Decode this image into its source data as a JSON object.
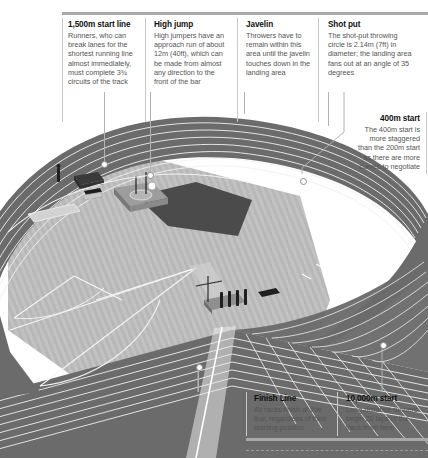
{
  "figure": {
    "rules": {
      "accent": "#a9a9a9",
      "divider": "#c9c9c9",
      "leader": "#b2b2b2"
    }
  },
  "callouts": {
    "top": [
      {
        "id": "start-1500m",
        "title": "1,500m start line",
        "body": "Runners, who can break lanes for the shortest running line almost immediately, must complete 3¾ circuits of the track"
      },
      {
        "id": "high-jump",
        "title": "High jump",
        "body": "High jumpers have an approach run of about 12m (40ft), which can be made from almost any direction to the front of the bar"
      },
      {
        "id": "javelin",
        "title": "Javelin",
        "body": "Throwers have to remain within this area until the javelin touches down in the landing area"
      },
      {
        "id": "shot-put",
        "title": "Shot put",
        "body": "The shot-put throwing circle is 2.14m (7ft) in diameter; the landing area fans out at an angle of 35 degrees"
      }
    ],
    "right": {
      "id": "start-400m",
      "title": "400m start",
      "body": "The 400m start is more staggered than the 200m start as there are more curves to negotiate"
    },
    "bottom": [
      {
        "id": "finish-line",
        "title": "Finish Line",
        "body": "All races finish at this line, regardless of their starting position"
      },
      {
        "id": "start-10000m",
        "title": "10,000m start",
        "body": "Long-distance runners begin 25 laps of the track from here"
      }
    ]
  },
  "track": {
    "lane_count": 8,
    "surface_color": "#6f6f6f",
    "lane_line_color": "#f2f2f2",
    "infield_color": "#bfbfbf",
    "sector_color": "#4f4f4f"
  }
}
